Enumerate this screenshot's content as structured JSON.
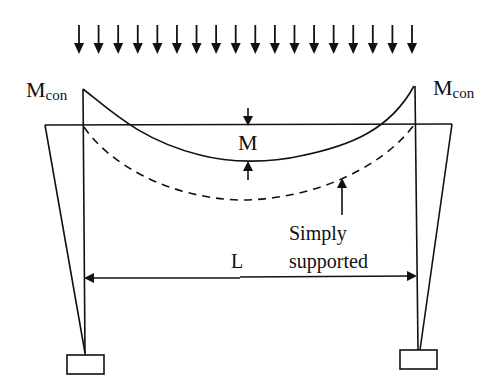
{
  "figure": {
    "type": "structural-diagram"
  },
  "labels": {
    "left_moment": "M",
    "left_moment_sub": "con",
    "right_moment": "M",
    "right_moment_sub": "con",
    "midspan_moment": "M",
    "span": "L",
    "simply_supported_line1": "Simply",
    "simply_supported_line2": "supported"
  },
  "load": {
    "kind": "uniformly distributed load",
    "arrow_count": 18
  },
  "curves": {
    "frame_moment": "solid",
    "simply_supported_moment": "dashed"
  },
  "colors": {
    "ink": "#111111",
    "background": "#ffffff"
  }
}
